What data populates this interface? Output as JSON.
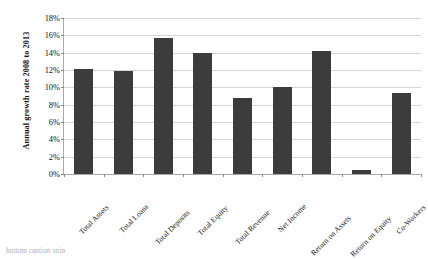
{
  "chart_data": {
    "type": "bar",
    "title": "",
    "xlabel": "",
    "ylabel": "Annual growth rate 2008 to 2013",
    "ylim": [
      0,
      18
    ],
    "ytick_labels": [
      "18%",
      "16%",
      "14%",
      "12%",
      "10%",
      "8%",
      "6%",
      "4%",
      "2%",
      "0%"
    ],
    "ytick_values": [
      18,
      16,
      14,
      12,
      10,
      8,
      6,
      4,
      2,
      0
    ],
    "grid": true,
    "legend": "none",
    "value_suffix": "%",
    "categories": [
      "Total Assets",
      "Total Loans",
      "Total Deposits",
      "Total Equity",
      "Total Revenue",
      "Net Income",
      "Return on Assets",
      "Return on Equity",
      "Co-Workers"
    ],
    "values": [
      12.1,
      11.9,
      15.7,
      14.0,
      8.8,
      10.0,
      14.2,
      0.5,
      9.3
    ],
    "bar_color": "#3c3c3c",
    "grid_color": "#d4d4d4",
    "axis_color": "#a9a9a9"
  },
  "caption": {
    "text": "bottom caption strip"
  }
}
